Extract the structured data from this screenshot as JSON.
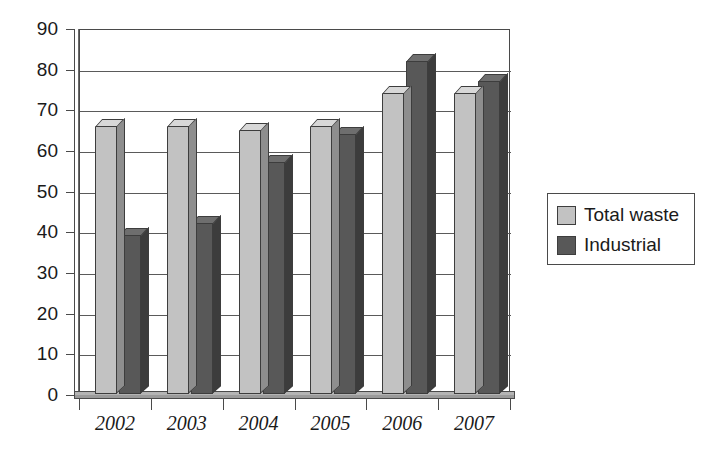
{
  "chart_data": {
    "type": "bar",
    "title": "",
    "subtitle": "",
    "xlabel": "",
    "ylabel": "",
    "categories": [
      "2002",
      "2003",
      "2004",
      "2005",
      "2006",
      "2007"
    ],
    "series": [
      {
        "name": "Total waste",
        "color": "#c2c2c2",
        "values": [
          66,
          66,
          65,
          66,
          74,
          74
        ]
      },
      {
        "name": "Industrial",
        "color": "#585858",
        "values": [
          39,
          42,
          57,
          64,
          82,
          77
        ]
      }
    ],
    "ylim": [
      0,
      90
    ],
    "ytick_step": 10,
    "yticks": [
      "90",
      "80",
      "70",
      "60",
      "50",
      "40",
      "30",
      "20",
      "10",
      "0"
    ],
    "ytick_values": [
      90,
      80,
      70,
      60,
      50,
      40,
      30,
      20,
      10,
      0
    ],
    "grid": true,
    "grid_axis": "y",
    "legend_position": "right",
    "style": "3d-column",
    "annotations": []
  },
  "legend": {
    "entries": [
      {
        "label": "Total waste",
        "swatch": "light"
      },
      {
        "label": "Industrial",
        "swatch": "dark"
      }
    ]
  },
  "colors": {
    "series_light": "#c2c2c2",
    "series_dark": "#585858",
    "axis": "#4a4a4a",
    "grid": "#5a5a5a",
    "background": "#ffffff",
    "text": "#1a1a1a"
  }
}
